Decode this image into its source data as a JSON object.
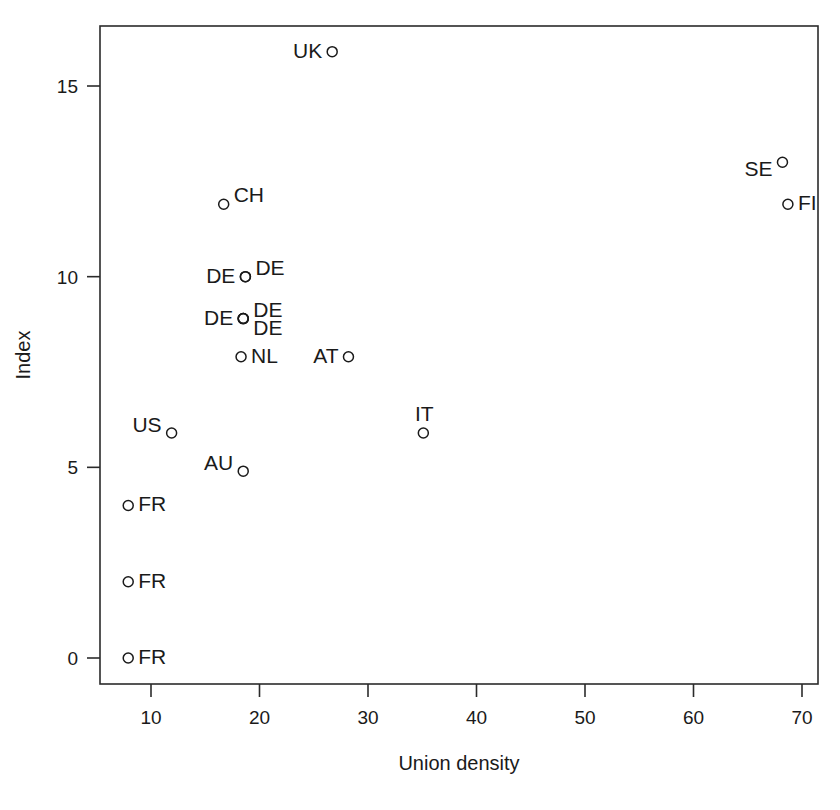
{
  "chart_data": {
    "type": "scatter",
    "title": "",
    "xlabel": "Union density",
    "ylabel": "Index",
    "xlim": [
      6.2,
      72.2
    ],
    "ylim": [
      -0.75,
      16.9
    ],
    "grid": false,
    "legend": "none",
    "marker_style": "open-circle",
    "xticks": [
      10,
      20,
      30,
      40,
      50,
      60,
      70
    ],
    "xtick_labels": [
      "10",
      "20",
      "30",
      "40",
      "50",
      "60",
      "70"
    ],
    "yticks": [
      0,
      5,
      10,
      15
    ],
    "ytick_labels": [
      "0",
      "5",
      "10",
      "15"
    ],
    "point_label_field": "label",
    "points": [
      {
        "label": "UK",
        "x": 26.7,
        "y": 15.9,
        "label_pos": "left"
      },
      {
        "label": "SE",
        "x": 68.2,
        "y": 13.0,
        "label_pos": "left-down"
      },
      {
        "label": "FI",
        "x": 68.7,
        "y": 11.9,
        "label_pos": "right"
      },
      {
        "label": "CH",
        "x": 16.7,
        "y": 11.9,
        "label_pos": "right-up"
      },
      {
        "label": "DE",
        "x": 18.7,
        "y": 10.0,
        "label_pos": "left"
      },
      {
        "label": "DE",
        "x": 18.7,
        "y": 10.0,
        "label_pos": "right-up"
      },
      {
        "label": "DE",
        "x": 18.5,
        "y": 8.9,
        "label_pos": "left"
      },
      {
        "label": "DE",
        "x": 18.5,
        "y": 8.9,
        "label_pos": "right-up"
      },
      {
        "label": "DE",
        "x": 18.5,
        "y": 8.9,
        "label_pos": "right-down"
      },
      {
        "label": "NL",
        "x": 18.3,
        "y": 7.9,
        "label_pos": "right"
      },
      {
        "label": "AT",
        "x": 28.2,
        "y": 7.9,
        "label_pos": "left"
      },
      {
        "label": "US",
        "x": 11.9,
        "y": 5.9,
        "label_pos": "left-up"
      },
      {
        "label": "IT",
        "x": 35.1,
        "y": 5.9,
        "label_pos": "up"
      },
      {
        "label": "AU",
        "x": 18.5,
        "y": 4.9,
        "label_pos": "left-up"
      },
      {
        "label": "FR",
        "x": 7.9,
        "y": 4.0,
        "label_pos": "right"
      },
      {
        "label": "FR",
        "x": 7.9,
        "y": 2.0,
        "label_pos": "right"
      },
      {
        "label": "FR",
        "x": 7.9,
        "y": 0.0,
        "label_pos": "right"
      }
    ]
  },
  "axes": {
    "x_title": "Union density",
    "y_title": "Index"
  }
}
